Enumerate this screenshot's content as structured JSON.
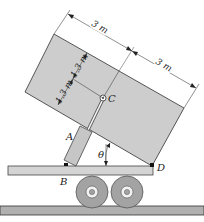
{
  "diagram": {
    "type": "dump-truck-mechanics-figure",
    "points": {
      "A": "A",
      "B": "B",
      "C": "C",
      "D": "D"
    },
    "angle_label": "θ",
    "dimensions": {
      "top_length_1": "3 m",
      "top_length_2": "3 m",
      "side_height_1": "1.3 m",
      "side_height_2": "1.3 m"
    },
    "colors": {
      "box_fill": "#cfcfcf",
      "outline": "#333333",
      "ground": "#a8a8a8",
      "wheel": "#a0a0a0",
      "platform": "#d0d0d0"
    }
  }
}
